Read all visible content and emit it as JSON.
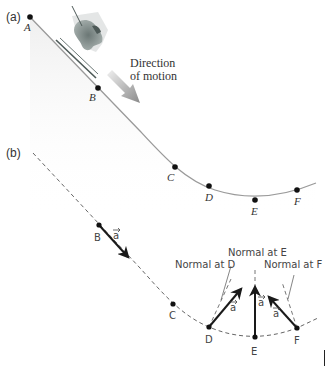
{
  "panel_a": {
    "label": "(a)",
    "points": [
      {
        "name": "A",
        "x": 30,
        "y": 17,
        "lx": 24,
        "ly": 30
      },
      {
        "name": "B",
        "x": 98,
        "y": 88,
        "lx": 89,
        "ly": 101
      },
      {
        "name": "C",
        "x": 175,
        "y": 167,
        "lx": 167,
        "ly": 180
      },
      {
        "name": "D",
        "x": 209,
        "y": 186,
        "lx": 205,
        "ly": 201
      },
      {
        "name": "E",
        "x": 255,
        "y": 200,
        "lx": 251,
        "ly": 215
      },
      {
        "name": "F",
        "x": 297,
        "y": 190,
        "lx": 294,
        "ly": 205
      }
    ],
    "direction_text": [
      "Direction",
      "of motion"
    ]
  },
  "panel_b": {
    "label": "(b)",
    "points": [
      {
        "name": "B",
        "x": 99,
        "y": 225,
        "lx": 94,
        "ly": 240
      },
      {
        "name": "C",
        "x": 173,
        "y": 304,
        "lx": 170,
        "ly": 318
      },
      {
        "name": "D",
        "x": 209,
        "y": 327,
        "lx": 205,
        "ly": 342
      },
      {
        "name": "E",
        "x": 255,
        "y": 337,
        "lx": 251,
        "ly": 354
      },
      {
        "name": "F",
        "x": 297,
        "y": 328,
        "lx": 294,
        "ly": 343
      }
    ],
    "vector_label": "a",
    "normal_labels": {
      "D": "Normal at D",
      "E": "Normal at E",
      "F": "Normal at F"
    }
  },
  "colors": {
    "curve": "#9a9a9a",
    "dashed": "#666666",
    "vector": "#1a1a1a",
    "point": "#111111",
    "arrow_gradient_start": "#e6e6e6",
    "arrow_gradient_end": "#888888"
  }
}
